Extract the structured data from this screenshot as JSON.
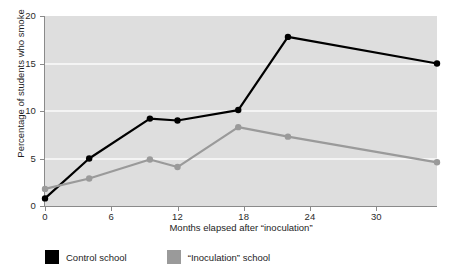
{
  "chart_data": {
    "type": "line",
    "title": "",
    "xlabel": "Months elapsed after “inoculation”",
    "ylabel": "Percentage of students who smoke",
    "xlim": [
      0,
      35.5
    ],
    "ylim": [
      0,
      20
    ],
    "xticks": [
      0,
      6,
      12,
      18,
      24,
      30
    ],
    "xtick_labels": [
      "0",
      "6",
      "12",
      "18",
      "24",
      "30"
    ],
    "yticks": [
      0,
      5,
      10,
      15,
      20
    ],
    "ytick_labels": [
      "0",
      "5",
      "10",
      "15",
      "20"
    ],
    "grid": true,
    "grid_axis": "y",
    "legend_position": "below-left",
    "plot_background": "#dedede",
    "gridline_color": "#f4f4f4",
    "series": [
      {
        "name": "Control school",
        "color": "#000000",
        "marker": "circle",
        "x": [
          0,
          4,
          9.5,
          12,
          17.5,
          22,
          35.5
        ],
        "values": [
          0.8,
          5.0,
          9.2,
          9.0,
          10.1,
          17.8,
          15.0
        ]
      },
      {
        "name": "“Inoculation” school",
        "color": "#9a9a9a",
        "marker": "circle",
        "x": [
          0,
          4,
          9.5,
          12,
          17.5,
          22,
          35.5
        ],
        "values": [
          1.8,
          2.9,
          4.9,
          4.1,
          8.3,
          7.3,
          4.6
        ]
      }
    ]
  },
  "legend": {
    "items": [
      {
        "label": "Control school",
        "color": "#000000"
      },
      {
        "label": "“Inoculation” school",
        "color": "#9a9a9a"
      }
    ]
  }
}
